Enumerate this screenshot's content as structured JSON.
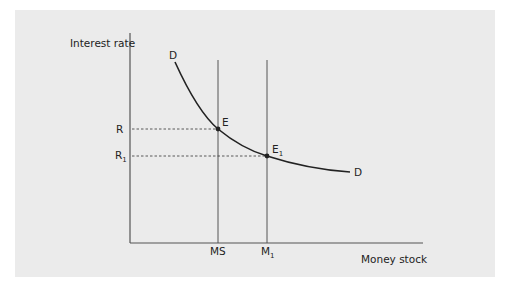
{
  "figure": {
    "y_axis_label": "Interest rate",
    "x_axis_label": "Money stock",
    "curve_label_top": "D",
    "curve_label_end": "D",
    "rate_labels": [
      {
        "main": "R",
        "sub": ""
      },
      {
        "main": "R",
        "sub": "1"
      }
    ],
    "supply_labels": [
      {
        "main": "MS",
        "sub": ""
      },
      {
        "main": "M",
        "sub": "1"
      }
    ],
    "point_labels": [
      {
        "main": "E",
        "sub": ""
      },
      {
        "main": "E",
        "sub": "1"
      }
    ]
  },
  "colors": {
    "panel": "#ebebeb",
    "curve": "#222222",
    "axis": "#555555"
  }
}
